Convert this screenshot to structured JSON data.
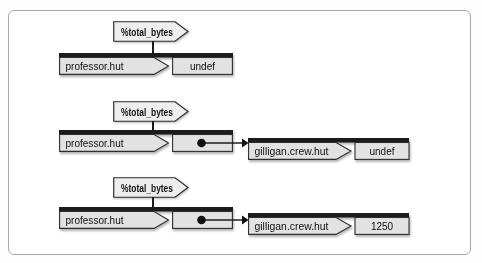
{
  "figure": {
    "type": "hash-structure-diagram",
    "background": "#ffffff",
    "frame_border_color": "#a8a8a8"
  },
  "colors": {
    "box_top_bar": "#1b1b1b",
    "box_fill": "#e2e2e2",
    "box_border": "#2e2e2e",
    "flag_fill": "#eeeeee",
    "text": "#101010"
  },
  "icons": {
    "reference_dot": "●",
    "arrow_right": "→"
  },
  "panels": [
    {
      "label": "%total_bytes",
      "key": "professor.hut",
      "value": "undef"
    },
    {
      "label": "%total_bytes",
      "key": "professor.hut",
      "value_is_reference": true,
      "ref": {
        "key": "gilligan.crew.hut",
        "value": "undef"
      }
    },
    {
      "label": "%total_bytes",
      "key": "professor.hut",
      "value_is_reference": true,
      "ref": {
        "key": "gilligan.crew.hut",
        "value": "1250"
      }
    }
  ]
}
